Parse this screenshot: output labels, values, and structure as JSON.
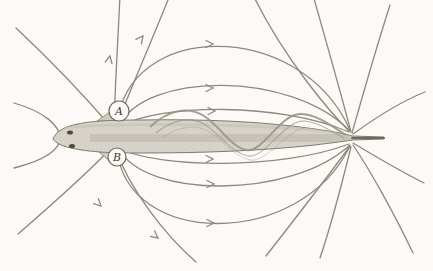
{
  "diagram": {
    "type": "electric-fish-field-diagram",
    "labels": {
      "a": "A",
      "b": "B"
    },
    "colors": {
      "background": "#fbfaf6",
      "field_line": "#8e887e",
      "fish_fill": "#d9d5cc",
      "fish_stroke": "#7d776d",
      "fin_line": "#9a9488",
      "label_text": "#3f3a33",
      "marker_stroke": "#6f6961",
      "marker_fill": "#fbfaf6"
    }
  }
}
